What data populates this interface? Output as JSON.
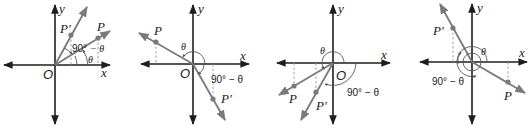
{
  "figure": {
    "panels": [
      {
        "id": "quadrant-1",
        "axis_x_label": "x",
        "axis_y_label": "y",
        "origin_label": "O",
        "point_label": "P",
        "point_prime_label": "P′",
        "angle_label": "θ",
        "complement_label_top": "90°",
        "complement_label_bottom": "− θ",
        "theta_label_small": "θ"
      },
      {
        "id": "quadrant-2",
        "axis_x_label": "x",
        "axis_y_label": "y",
        "origin_label": "O",
        "point_label": "P",
        "point_prime_label": "P′",
        "angle_label": "θ",
        "complement_label": "90° − θ"
      },
      {
        "id": "quadrant-3",
        "axis_x_label": "x",
        "axis_y_label": "y",
        "origin_label": "O",
        "point_label": "P",
        "point_prime_label": "P′",
        "angle_label": "θ",
        "complement_label": "90° − θ"
      },
      {
        "id": "quadrant-4",
        "axis_x_label": "x",
        "axis_y_label": "y",
        "origin_label": "O",
        "point_label": "P",
        "point_prime_label": "P′",
        "angle_label": "θ",
        "complement_label": "90° − θ"
      }
    ],
    "colors": {
      "axis": "#1e1e1e",
      "ray": "#7a7a7a",
      "text": "#1a1a1a"
    }
  }
}
